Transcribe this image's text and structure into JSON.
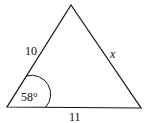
{
  "diagram": {
    "type": "triangle",
    "sides": {
      "left": "10",
      "right": "x",
      "bottom": "11"
    },
    "angle": {
      "vertex": "bottom-left",
      "label": "58°"
    },
    "colors": {
      "stroke": "#111111",
      "background": "#ffffff"
    }
  }
}
